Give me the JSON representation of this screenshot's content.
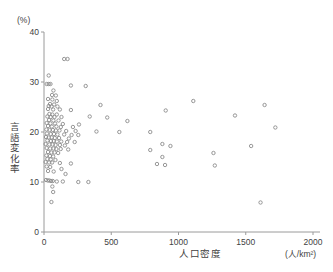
{
  "figure": {
    "background_color": "#ffffff",
    "axis_color": "#9a9a9a",
    "marker_color": "#8c8c8c",
    "text_color": "#3f3f3f"
  },
  "chart_data": {
    "type": "scatter",
    "title": "",
    "xlabel": "人口密度",
    "ylabel": "言語変化率",
    "xunit": "(人/km²)",
    "yunit": "(%)",
    "xlim": [
      0,
      2000
    ],
    "ylim": [
      0,
      40
    ],
    "xticks": [
      0,
      500,
      1000,
      1500,
      2000
    ],
    "yticks": [
      0,
      10,
      20,
      30,
      40
    ],
    "xticklabels": [
      "0",
      "500",
      "1000",
      "1500",
      "2000"
    ],
    "yticklabels": [
      "0",
      "10",
      "20",
      "30",
      "40"
    ],
    "grid": false,
    "legend": null,
    "marker_style": "open-circle",
    "n_points": 131,
    "points": [
      [
        150,
        34.6
      ],
      [
        175,
        34.6
      ],
      [
        35,
        31.3
      ],
      [
        20,
        29.6
      ],
      [
        35,
        29.6
      ],
      [
        48,
        29.6
      ],
      [
        200,
        29.3
      ],
      [
        310,
        29.2
      ],
      [
        70,
        28.3
      ],
      [
        60,
        27.4
      ],
      [
        88,
        27.3
      ],
      [
        30,
        26.6
      ],
      [
        62,
        26.5
      ],
      [
        95,
        26.2
      ],
      [
        1110,
        26.2
      ],
      [
        45,
        25.6
      ],
      [
        75,
        25.5
      ],
      [
        35,
        25.2
      ],
      [
        56,
        25.1
      ],
      [
        100,
        25.1
      ],
      [
        420,
        25.4
      ],
      [
        1640,
        25.4
      ],
      [
        30,
        24.6
      ],
      [
        68,
        24.5
      ],
      [
        118,
        24.5
      ],
      [
        200,
        24.4
      ],
      [
        905,
        24.3
      ],
      [
        40,
        23.6
      ],
      [
        62,
        23.5
      ],
      [
        95,
        23.5
      ],
      [
        1420,
        23.3
      ],
      [
        25,
        23.1
      ],
      [
        50,
        23.0
      ],
      [
        78,
        23.0
      ],
      [
        130,
        23.0
      ],
      [
        340,
        23.1
      ],
      [
        470,
        22.9
      ],
      [
        38,
        22.4
      ],
      [
        70,
        22.3
      ],
      [
        108,
        22.3
      ],
      [
        620,
        22.2
      ],
      [
        20,
        21.8
      ],
      [
        48,
        21.7
      ],
      [
        82,
        21.7
      ],
      [
        140,
        21.6
      ],
      [
        260,
        21.5
      ],
      [
        30,
        21.2
      ],
      [
        58,
        21.1
      ],
      [
        92,
        21.1
      ],
      [
        125,
        21.0
      ],
      [
        215,
        21.0
      ],
      [
        1720,
        20.9
      ],
      [
        18,
        20.5
      ],
      [
        42,
        20.4
      ],
      [
        66,
        20.4
      ],
      [
        88,
        20.3
      ],
      [
        115,
        20.3
      ],
      [
        165,
        20.2
      ],
      [
        235,
        20.2
      ],
      [
        390,
        20.1
      ],
      [
        560,
        20.0
      ],
      [
        790,
        20.0
      ],
      [
        22,
        19.7
      ],
      [
        50,
        19.6
      ],
      [
        74,
        19.6
      ],
      [
        100,
        19.5
      ],
      [
        150,
        19.5
      ],
      [
        205,
        19.4
      ],
      [
        255,
        19.4
      ],
      [
        15,
        19.0
      ],
      [
        35,
        18.9
      ],
      [
        58,
        18.9
      ],
      [
        80,
        18.8
      ],
      [
        112,
        18.8
      ],
      [
        185,
        18.7
      ],
      [
        25,
        18.3
      ],
      [
        52,
        18.2
      ],
      [
        72,
        18.2
      ],
      [
        96,
        18.1
      ],
      [
        128,
        18.1
      ],
      [
        172,
        18.0
      ],
      [
        228,
        18.0
      ],
      [
        12,
        17.6
      ],
      [
        40,
        17.5
      ],
      [
        64,
        17.5
      ],
      [
        86,
        17.4
      ],
      [
        118,
        17.4
      ],
      [
        155,
        17.3
      ],
      [
        880,
        17.6
      ],
      [
        940,
        17.2
      ],
      [
        1540,
        17.2
      ],
      [
        20,
        16.8
      ],
      [
        46,
        16.7
      ],
      [
        70,
        16.7
      ],
      [
        92,
        16.6
      ],
      [
        124,
        16.6
      ],
      [
        180,
        16.5
      ],
      [
        790,
        16.4
      ],
      [
        30,
        16.0
      ],
      [
        55,
        15.9
      ],
      [
        78,
        15.9
      ],
      [
        105,
        15.8
      ],
      [
        1260,
        15.8
      ],
      [
        18,
        15.3
      ],
      [
        44,
        15.2
      ],
      [
        68,
        15.1
      ],
      [
        880,
        15.0
      ],
      [
        25,
        14.6
      ],
      [
        50,
        14.5
      ],
      [
        85,
        14.4
      ],
      [
        12,
        14.0
      ],
      [
        38,
        13.9
      ],
      [
        60,
        13.9
      ],
      [
        118,
        13.8
      ],
      [
        200,
        13.7
      ],
      [
        840,
        13.6
      ],
      [
        900,
        13.4
      ],
      [
        1270,
        13.3
      ],
      [
        20,
        13.1
      ],
      [
        46,
        13.0
      ],
      [
        130,
        12.6
      ],
      [
        30,
        12.2
      ],
      [
        72,
        12.1
      ],
      [
        160,
        11.6
      ],
      [
        15,
        10.4
      ],
      [
        28,
        10.3
      ],
      [
        40,
        10.3
      ],
      [
        52,
        10.2
      ],
      [
        65,
        10.2
      ],
      [
        95,
        10.1
      ],
      [
        140,
        10.1
      ],
      [
        255,
        10.0
      ],
      [
        330,
        10.0
      ],
      [
        62,
        9.1
      ],
      [
        68,
        8.0
      ],
      [
        55,
        6.0
      ],
      [
        1610,
        5.9
      ]
    ]
  }
}
